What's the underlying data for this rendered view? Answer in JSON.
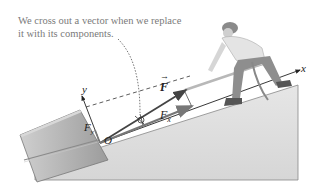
{
  "caption": {
    "line1": "We cross out a vector when we replace",
    "line2": "it with its components."
  },
  "labels": {
    "force": "F",
    "force_x_base": "F",
    "force_x_sub": "x",
    "force_y_base": "F",
    "force_y_sub": "y",
    "origin": "O",
    "axis_x": "x",
    "axis_y": "y"
  },
  "colors": {
    "ramp": "#dcdcdc",
    "box": "#b8b8b8",
    "vector": "#555555",
    "caption": "#7a7a7a"
  }
}
